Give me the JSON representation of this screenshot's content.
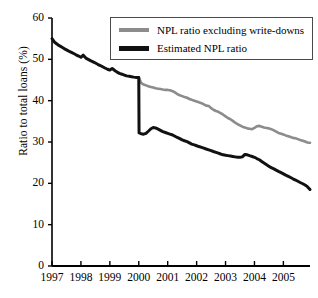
{
  "chart_data": {
    "type": "line",
    "title": "",
    "subtitle": "",
    "xlabel": "",
    "ylabel": "Ratio to total loans (%)",
    "xlim": [
      1997,
      2005.92
    ],
    "ylim": [
      0,
      60
    ],
    "ytick_labels": [
      "0",
      "10",
      "20",
      "30",
      "40",
      "50",
      "60"
    ],
    "ytick_values": [
      0,
      10,
      20,
      30,
      40,
      50,
      60
    ],
    "xtick_labels": [
      "1997",
      "1998",
      "1999",
      "2000",
      "2001",
      "2002",
      "2003",
      "2004",
      "2005"
    ],
    "xtick_values": [
      1997,
      1998,
      1999,
      2000,
      2001,
      2002,
      2003,
      2004,
      2005
    ],
    "grid": false,
    "legend_position": "top-right",
    "series": [
      {
        "name": "NPL ratio excluding write-downs",
        "color": "#8c8c8c",
        "width": 2.6,
        "x": [
          2000.0,
          2000.08,
          2000.17,
          2000.25,
          2000.33,
          2000.42,
          2000.5,
          2000.58,
          2000.67,
          2000.75,
          2000.83,
          2000.92,
          2001.0,
          2001.08,
          2001.17,
          2001.25,
          2001.33,
          2001.42,
          2001.5,
          2001.58,
          2001.67,
          2001.75,
          2001.83,
          2001.92,
          2002.0,
          2002.08,
          2002.17,
          2002.25,
          2002.33,
          2002.42,
          2002.5,
          2002.58,
          2002.67,
          2002.75,
          2002.83,
          2002.92,
          2003.0,
          2003.08,
          2003.17,
          2003.25,
          2003.33,
          2003.42,
          2003.5,
          2003.58,
          2003.67,
          2003.75,
          2003.83,
          2003.92,
          2004.0,
          2004.08,
          2004.17,
          2004.25,
          2004.33,
          2004.42,
          2004.5,
          2004.58,
          2004.67,
          2004.75,
          2004.83,
          2004.92,
          2005.0,
          2005.08,
          2005.17,
          2005.25,
          2005.33,
          2005.42,
          2005.5,
          2005.58,
          2005.67,
          2005.75,
          2005.83,
          2005.92
        ],
        "values": [
          45.6,
          44.3,
          43.9,
          43.7,
          43.5,
          43.3,
          43.2,
          43.0,
          42.9,
          42.8,
          42.7,
          42.6,
          42.6,
          42.5,
          42.3,
          42.0,
          41.6,
          41.3,
          41.1,
          40.9,
          40.7,
          40.4,
          40.2,
          40.0,
          39.8,
          39.6,
          39.4,
          39.1,
          38.8,
          38.7,
          38.2,
          37.8,
          37.5,
          37.3,
          37.0,
          36.6,
          36.2,
          35.8,
          35.5,
          35.1,
          34.7,
          34.3,
          34.0,
          33.7,
          33.5,
          33.3,
          33.2,
          33.1,
          33.4,
          33.8,
          33.9,
          33.7,
          33.5,
          33.4,
          33.3,
          33.1,
          32.8,
          32.5,
          32.2,
          32.0,
          31.8,
          31.6,
          31.4,
          31.2,
          31.0,
          30.9,
          30.7,
          30.5,
          30.3,
          30.1,
          29.9,
          29.8
        ]
      },
      {
        "name": "Estimated NPL ratio",
        "color": "#111111",
        "width": 3.0,
        "x": [
          1997.0,
          1997.08,
          1997.17,
          1997.25,
          1997.33,
          1997.42,
          1997.5,
          1997.58,
          1997.67,
          1997.75,
          1997.83,
          1997.92,
          1998.0,
          1998.08,
          1998.17,
          1998.25,
          1998.33,
          1998.42,
          1998.5,
          1998.58,
          1998.67,
          1998.75,
          1998.83,
          1998.92,
          1999.0,
          1999.08,
          1999.17,
          1999.25,
          1999.33,
          1999.42,
          1999.5,
          1999.58,
          1999.67,
          1999.75,
          1999.83,
          1999.92,
          2000.0,
          2000.01,
          2000.08,
          2000.17,
          2000.25,
          2000.33,
          2000.42,
          2000.5,
          2000.58,
          2000.67,
          2000.75,
          2000.83,
          2000.92,
          2001.0,
          2001.08,
          2001.17,
          2001.25,
          2001.33,
          2001.42,
          2001.5,
          2001.58,
          2001.67,
          2001.75,
          2001.83,
          2001.92,
          2002.0,
          2002.08,
          2002.17,
          2002.25,
          2002.33,
          2002.42,
          2002.5,
          2002.58,
          2002.67,
          2002.75,
          2002.83,
          2002.92,
          2003.0,
          2003.08,
          2003.17,
          2003.25,
          2003.33,
          2003.42,
          2003.5,
          2003.58,
          2003.67,
          2003.75,
          2003.83,
          2003.92,
          2004.0,
          2004.08,
          2004.17,
          2004.25,
          2004.33,
          2004.42,
          2004.5,
          2004.58,
          2004.67,
          2004.75,
          2004.83,
          2004.92,
          2005.0,
          2005.08,
          2005.17,
          2005.25,
          2005.33,
          2005.42,
          2005.5,
          2005.58,
          2005.67,
          2005.75,
          2005.83,
          2005.92
        ],
        "values": [
          55.0,
          54.2,
          53.7,
          53.3,
          53.0,
          52.6,
          52.3,
          52.0,
          51.7,
          51.4,
          51.1,
          50.8,
          50.5,
          51.0,
          50.3,
          50.0,
          49.7,
          49.4,
          49.1,
          48.8,
          48.5,
          48.2,
          47.9,
          47.6,
          47.4,
          47.8,
          47.3,
          46.9,
          46.6,
          46.4,
          46.2,
          46.0,
          45.9,
          45.8,
          45.7,
          45.6,
          45.6,
          32.2,
          32.0,
          31.9,
          32.1,
          32.6,
          33.2,
          33.5,
          33.4,
          33.1,
          32.8,
          32.5,
          32.3,
          32.1,
          31.9,
          31.7,
          31.4,
          31.1,
          30.8,
          30.5,
          30.3,
          30.1,
          29.8,
          29.5,
          29.3,
          29.1,
          28.9,
          28.7,
          28.5,
          28.3,
          28.1,
          27.9,
          27.7,
          27.5,
          27.3,
          27.1,
          26.9,
          26.8,
          26.7,
          26.6,
          26.5,
          26.4,
          26.3,
          26.3,
          26.4,
          27.0,
          26.9,
          26.7,
          26.5,
          26.3,
          26.0,
          25.7,
          25.3,
          24.9,
          24.5,
          24.1,
          23.8,
          23.5,
          23.2,
          22.9,
          22.6,
          22.3,
          22.0,
          21.7,
          21.4,
          21.1,
          20.8,
          20.5,
          20.2,
          19.9,
          19.6,
          19.2,
          18.5
        ]
      }
    ],
    "legend": [
      {
        "label": "NPL ratio excluding write-downs",
        "color": "#8c8c8c"
      },
      {
        "label": "Estimated NPL ratio",
        "color": "#111111"
      }
    ]
  },
  "axis": {
    "line_color": "#000000"
  }
}
